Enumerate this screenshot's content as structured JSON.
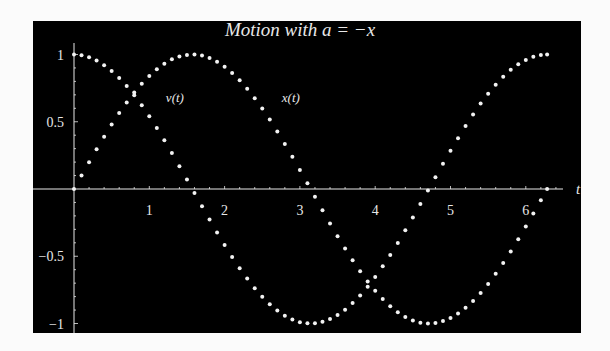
{
  "chart_data": {
    "type": "scatter",
    "title": "Motion with a = −x",
    "xlabel": "t",
    "ylabel": "",
    "xlim": [
      0,
      6.6
    ],
    "ylim": [
      -1,
      1
    ],
    "grid": false,
    "legend": "inline labels",
    "x_ticks": [
      1,
      2,
      3,
      4,
      5,
      6
    ],
    "x_tick_labels": [
      "1",
      "2",
      "3",
      "4",
      "5",
      "6"
    ],
    "y_ticks": [
      1,
      0.5,
      -0.5,
      -1
    ],
    "y_tick_labels": [
      "1",
      "0.5",
      "−0.5",
      "−1"
    ],
    "annotations": [
      {
        "text": "v(t)",
        "x": 1.22,
        "y": 0.68
      },
      {
        "text": "x(t)",
        "x": 2.76,
        "y": 0.68
      }
    ],
    "t": [
      0,
      0.1,
      0.2,
      0.3,
      0.4,
      0.5,
      0.6,
      0.7,
      0.8,
      0.9,
      1.0,
      1.1,
      1.2,
      1.3,
      1.4,
      1.5,
      1.6,
      1.7,
      1.8,
      1.9,
      2.0,
      2.1,
      2.2,
      2.3,
      2.4,
      2.5,
      2.6,
      2.7,
      2.8,
      2.9,
      3.0,
      3.1,
      3.2,
      3.3,
      3.4,
      3.5,
      3.6,
      3.7,
      3.8,
      3.9,
      4.0,
      4.1,
      4.2,
      4.3,
      4.4,
      4.5,
      4.6,
      4.7,
      4.8,
      4.9,
      5.0,
      5.1,
      5.2,
      5.3,
      5.4,
      5.5,
      5.6,
      5.7,
      5.8,
      5.9,
      6.0,
      6.1,
      6.2,
      6.283
    ],
    "series": [
      {
        "name": "x(t)",
        "function": "cos(t)",
        "values": [
          1,
          0.995,
          0.98,
          0.955,
          0.921,
          0.878,
          0.825,
          0.765,
          0.697,
          0.622,
          0.54,
          0.454,
          0.362,
          0.267,
          0.17,
          0.071,
          -0.029,
          -0.129,
          -0.227,
          -0.323,
          -0.416,
          -0.505,
          -0.589,
          -0.666,
          -0.737,
          -0.801,
          -0.857,
          -0.904,
          -0.942,
          -0.971,
          -0.99,
          -0.999,
          -0.998,
          -0.987,
          -0.967,
          -0.936,
          -0.897,
          -0.848,
          -0.791,
          -0.726,
          -0.654,
          -0.575,
          -0.49,
          -0.401,
          -0.307,
          -0.211,
          -0.112,
          -0.012,
          0.087,
          0.187,
          0.284,
          0.378,
          0.469,
          0.554,
          0.635,
          0.709,
          0.776,
          0.835,
          0.886,
          0.927,
          0.96,
          0.983,
          0.997,
          1
        ]
      },
      {
        "name": "v(t)",
        "function": "sin(t)",
        "values": [
          0,
          0.1,
          0.199,
          0.296,
          0.389,
          0.479,
          0.565,
          0.644,
          0.717,
          0.783,
          0.841,
          0.891,
          0.932,
          0.964,
          0.985,
          0.997,
          1,
          0.992,
          0.974,
          0.946,
          0.909,
          0.863,
          0.808,
          0.746,
          0.675,
          0.598,
          0.516,
          0.427,
          0.335,
          0.239,
          0.141,
          0.042,
          -0.058,
          -0.158,
          -0.256,
          -0.351,
          -0.443,
          -0.53,
          -0.612,
          -0.688,
          -0.757,
          -0.818,
          -0.872,
          -0.916,
          -0.952,
          -0.978,
          -0.994,
          -1,
          -0.996,
          -0.982,
          -0.959,
          -0.926,
          -0.883,
          -0.832,
          -0.773,
          -0.706,
          -0.631,
          -0.551,
          -0.465,
          -0.374,
          -0.279,
          -0.182,
          -0.083,
          0
        ]
      }
    ]
  },
  "colors": {
    "background": "#000000",
    "foreground": "#e8e8e8",
    "page": "#fbfbfb"
  }
}
